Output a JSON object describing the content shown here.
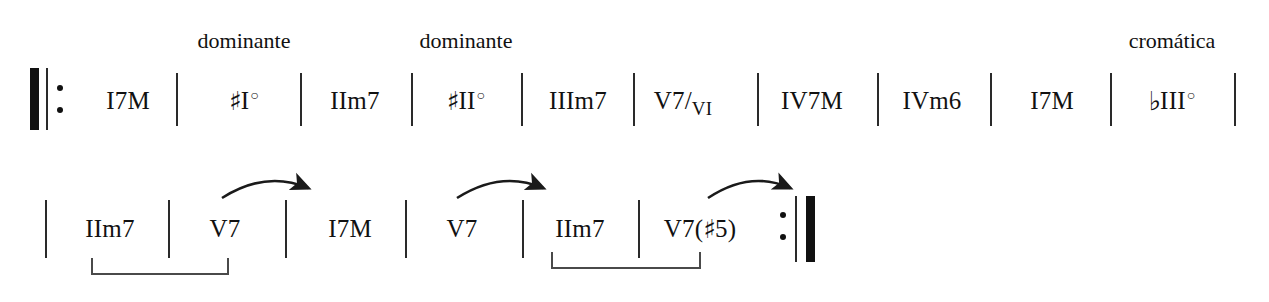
{
  "sheet": {
    "title": "chord-progression-chart",
    "ink_color": "#111111",
    "background_color": "#ffffff"
  },
  "annotations": [
    {
      "id": "dominante-1",
      "text": "dominante",
      "x": 244,
      "y": 30
    },
    {
      "id": "dominante-2",
      "text": "dominante",
      "x": 466,
      "y": 30
    },
    {
      "id": "cromatica",
      "text": "cromática",
      "x": 1172,
      "y": 30
    }
  ],
  "systems": [
    {
      "id": "system-1",
      "start_repeat": true,
      "end_repeat": false,
      "measures": [
        {
          "id": "m1",
          "label": "I7M",
          "roman": "I",
          "quality": "7M",
          "accidental": "",
          "diminished": false,
          "x": 128
        },
        {
          "id": "m2",
          "label": "♯I°",
          "roman": "I",
          "quality": "",
          "accidental": "♯",
          "diminished": true,
          "x": 244
        },
        {
          "id": "m3",
          "label": "IIm7",
          "roman": "II",
          "quality": "m7",
          "accidental": "",
          "diminished": false,
          "x": 355
        },
        {
          "id": "m4",
          "label": "♯II°",
          "roman": "II",
          "quality": "",
          "accidental": "♯",
          "diminished": true,
          "x": 466
        },
        {
          "id": "m5",
          "label": "IIIm7",
          "roman": "III",
          "quality": "m7",
          "accidental": "",
          "diminished": false,
          "x": 578
        },
        {
          "id": "m6",
          "label": "V7/VI",
          "roman": "V",
          "quality": "7",
          "accidental": "",
          "diminished": false,
          "secondary": "VI",
          "x": 683
        },
        {
          "id": "m7",
          "label": "IV7M",
          "roman": "IV",
          "quality": "7M",
          "accidental": "",
          "diminished": false,
          "x": 812
        },
        {
          "id": "m8",
          "label": "IVm6",
          "roman": "IV",
          "quality": "m6",
          "accidental": "",
          "diminished": false,
          "x": 932
        },
        {
          "id": "m9",
          "label": "I7M",
          "roman": "I",
          "quality": "7M",
          "accidental": "",
          "diminished": false,
          "x": 1052
        },
        {
          "id": "m10",
          "label": "♭III°",
          "roman": "III",
          "quality": "",
          "accidental": "♭",
          "diminished": true,
          "x": 1172
        }
      ],
      "barlines_x": [
        176,
        300,
        411,
        521,
        633,
        757,
        877,
        990,
        1110,
        1234
      ],
      "bar_top": 73,
      "bar_bottom": 126,
      "text_y": 88,
      "repeat_start": {
        "thick_x": 30,
        "thin_x": 46,
        "dots_x": 57,
        "top": 68,
        "bottom": 130
      }
    },
    {
      "id": "system-2",
      "start_repeat": false,
      "end_repeat": true,
      "measures": [
        {
          "id": "m11",
          "label": "IIm7",
          "roman": "II",
          "quality": "m7",
          "accidental": "",
          "diminished": false,
          "x": 110
        },
        {
          "id": "m12",
          "label": "V7",
          "roman": "V",
          "quality": "7",
          "accidental": "",
          "diminished": false,
          "x": 225
        },
        {
          "id": "m13",
          "label": "I7M",
          "roman": "I",
          "quality": "7M",
          "accidental": "",
          "diminished": false,
          "x": 350
        },
        {
          "id": "m14",
          "label": "V7",
          "roman": "V",
          "quality": "7",
          "accidental": "",
          "diminished": false,
          "x": 462
        },
        {
          "id": "m15",
          "label": "IIm7",
          "roman": "II",
          "quality": "m7",
          "accidental": "",
          "diminished": false,
          "x": 580
        },
        {
          "id": "m16",
          "label": "V7(♯5)",
          "roman": "V",
          "quality": "7(♯5)",
          "accidental": "",
          "diminished": false,
          "x": 700
        }
      ],
      "barlines_x": [
        45,
        168,
        285,
        405,
        522,
        638
      ],
      "bar_top": 200,
      "bar_bottom": 258,
      "text_y": 216,
      "repeat_end": {
        "dots_x": 780,
        "thin_x": 795,
        "thick_x": 806,
        "top": 196,
        "bottom": 262
      }
    }
  ],
  "arrows": [
    {
      "id": "arrow-1",
      "from_x": 222,
      "to_x": 310,
      "y": 190,
      "points_to": "m13"
    },
    {
      "id": "arrow-2",
      "from_x": 457,
      "to_x": 545,
      "y": 190,
      "points_to": "m15"
    },
    {
      "id": "arrow-3",
      "from_x": 708,
      "to_x": 792,
      "y": 190,
      "points_to": "repeat-end"
    }
  ],
  "brackets": [
    {
      "id": "bracket-1",
      "from_x": 92,
      "to_x": 228,
      "y": 272,
      "groups": [
        "m11",
        "m12"
      ]
    },
    {
      "id": "bracket-2",
      "from_x": 552,
      "to_x": 700,
      "y": 272,
      "groups": [
        "m15",
        "m16"
      ]
    }
  ]
}
